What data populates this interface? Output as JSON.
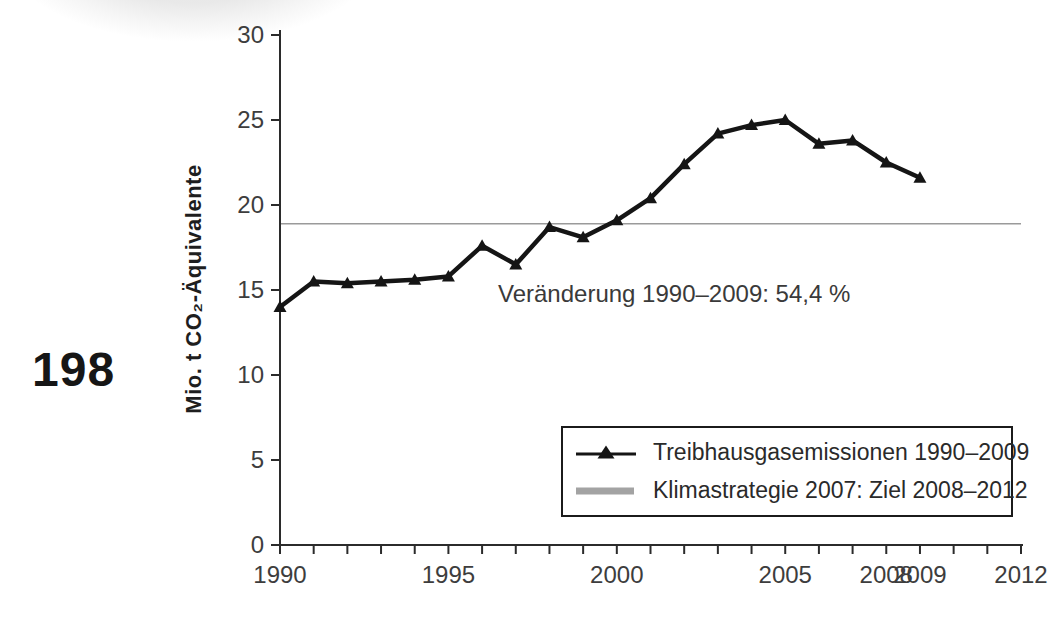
{
  "page": {
    "page_number": "198"
  },
  "chart_data": {
    "type": "line",
    "x": [
      1990,
      1991,
      1992,
      1993,
      1994,
      1995,
      1996,
      1997,
      1998,
      1999,
      2000,
      2001,
      2002,
      2003,
      2004,
      2005,
      2006,
      2007,
      2008,
      2009
    ],
    "series": [
      {
        "name": "Treibhausgasemissionen 1990–2009",
        "values": [
          14.0,
          15.5,
          15.4,
          15.5,
          15.6,
          15.8,
          17.6,
          16.5,
          18.7,
          18.1,
          19.1,
          20.4,
          22.4,
          24.2,
          24.7,
          25.0,
          23.6,
          23.8,
          22.5,
          21.6
        ],
        "color": "#151515",
        "marker": "triangle"
      }
    ],
    "target_line": {
      "label": "Klimastrategie 2007: Ziel 2008–2012",
      "value": 18.9,
      "span": [
        1990,
        2012
      ],
      "color": "#9a9a9a"
    },
    "annotation": {
      "text": "Veränderung 1990–2009: 54,4 %"
    },
    "title": "",
    "xlabel": "",
    "ylabel": "Mio. t CO₂-Äquivalente",
    "ylim": [
      0,
      30
    ],
    "xlim": [
      1990,
      2012
    ],
    "y_ticks": [
      0,
      5,
      10,
      15,
      20,
      25,
      30
    ],
    "x_tick_step": 1,
    "x_tick_labels": [
      1990,
      1995,
      2000,
      2005,
      2008,
      2009,
      2012
    ],
    "legend_position": "lower right",
    "grid": false
  }
}
